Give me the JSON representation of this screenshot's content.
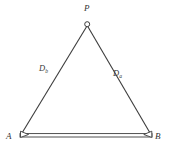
{
  "figure": {
    "type": "geometry-diagram",
    "background_color": "#ffffff",
    "line_color": "#3c3c3c",
    "labels": {
      "apex": "P",
      "base_left": "A",
      "base_right": "B",
      "left_edge": "D",
      "left_edge_subscript": "b",
      "right_edge": "D",
      "right_edge_subscript": "a"
    },
    "geometry": {
      "apex_point": {
        "x": 87,
        "y": 24
      },
      "base_left_point": {
        "x": 20,
        "y": 136
      },
      "base_right_point": {
        "x": 152,
        "y": 136
      },
      "apex_marker": "circle",
      "base_markers": "triangle",
      "baseline_style": "double-line"
    }
  }
}
